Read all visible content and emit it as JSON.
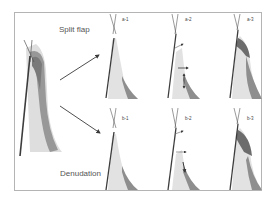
{
  "figure": {
    "rows": [
      {
        "title": "Split flap",
        "panels": [
          {
            "id": "a-1",
            "label": "a-1"
          },
          {
            "id": "a-2",
            "label": "a-2"
          },
          {
            "id": "a-3",
            "label": "a-3"
          }
        ]
      },
      {
        "title": "Denudation",
        "panels": [
          {
            "id": "b-1",
            "label": "b-1"
          },
          {
            "id": "b-2",
            "label": "b-2"
          },
          {
            "id": "b-3",
            "label": "b-3"
          }
        ]
      }
    ],
    "colors": {
      "frame": "#b4b4b4",
      "tooth": "#3c3c3c",
      "tissue_light": "#dcdcdc",
      "tissue_dark": "#8a8a8a",
      "arrow": "#3a3a3a"
    }
  }
}
